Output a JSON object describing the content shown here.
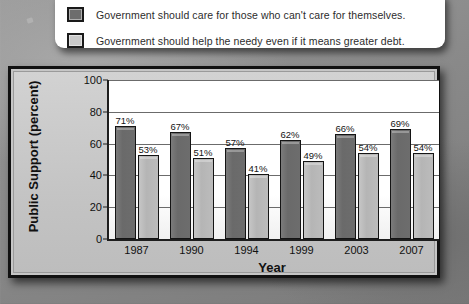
{
  "legend": {
    "items": [
      {
        "swatch": "dark",
        "label": "Government should care for those who can't care for themselves."
      },
      {
        "swatch": "light",
        "label": "Government should help the needy even if it means greater debt."
      }
    ]
  },
  "colors": {
    "series_dark": "#6d6d6d",
    "series_light": "#bcbcbc",
    "frame": "#111111",
    "panel": "#c6c6c6",
    "plot_background": "#ffffff",
    "gridline": "#6b6b6b",
    "text": "#111111"
  },
  "chart_data": {
    "type": "bar",
    "title": "",
    "xlabel": "Year",
    "ylabel": "Public Support (percent)",
    "categories": [
      "1987",
      "1990",
      "1994",
      "1999",
      "2003",
      "2007"
    ],
    "series": [
      {
        "name": "Government should care for those who can't care for themselves.",
        "values": [
          71,
          67,
          57,
          62,
          66,
          69
        ],
        "labels": [
          "71%",
          "67%",
          "57%",
          "62%",
          "66%",
          "69%"
        ],
        "color": "#6d6d6d"
      },
      {
        "name": "Government should help the needy even if it means greater debt.",
        "values": [
          53,
          51,
          41,
          49,
          54,
          54
        ],
        "labels": [
          "53%",
          "51%",
          "41%",
          "49%",
          "54%",
          "54%"
        ],
        "color": "#bcbcbc"
      }
    ],
    "ylim": [
      0,
      100
    ],
    "yticks": [
      0,
      20,
      40,
      60,
      80,
      100
    ],
    "ytick_labels": [
      "0",
      "20",
      "40",
      "60",
      "80",
      "100"
    ],
    "grid": true,
    "legend_position": "top"
  }
}
